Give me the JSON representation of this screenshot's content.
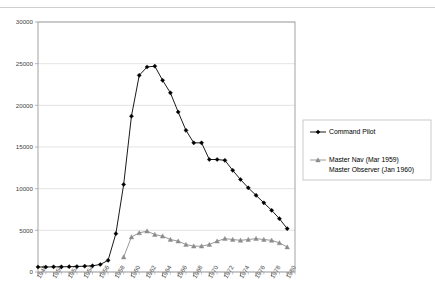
{
  "figure": {
    "top_fragment": "",
    "background": "#ffffff"
  },
  "legend": {
    "position": "right",
    "entries": [
      {
        "label": "Command Pilot",
        "color": "#000000",
        "marker": "diamond-marker"
      },
      {
        "label_line1": "Master Nav (Mar 1959)",
        "label_line2": "Master Observer (Jan 1960)",
        "color": "#8c8c8c",
        "marker": "triangle-marker"
      }
    ]
  },
  "axes": {
    "y_ticks": [
      "0",
      "5000",
      "10000",
      "15000",
      "20000",
      "25000",
      "30000"
    ],
    "x_ticks": [
      "1948",
      "1950",
      "1952",
      "1954",
      "1956",
      "1958",
      "1960",
      "1962",
      "1964",
      "1966",
      "1968",
      "1970",
      "1972",
      "1974",
      "1976",
      "1978",
      "1980"
    ]
  },
  "chart_data": {
    "type": "line",
    "title": "",
    "subtitle": "",
    "xlabel": "",
    "ylabel": "",
    "xlim": [
      1948,
      1981
    ],
    "ylim": [
      0,
      30000
    ],
    "grid": true,
    "legend_position": "right",
    "x": [
      1948,
      1949,
      1950,
      1951,
      1952,
      1953,
      1954,
      1955,
      1956,
      1957,
      1958,
      1959,
      1960,
      1961,
      1962,
      1963,
      1964,
      1965,
      1966,
      1967,
      1968,
      1969,
      1970,
      1971,
      1972,
      1973,
      1974,
      1975,
      1976,
      1977,
      1978,
      1979,
      1980
    ],
    "series": [
      {
        "name": "Command Pilot",
        "color": "#000000",
        "marker": "diamond",
        "values": [
          600,
          600,
          620,
          620,
          640,
          660,
          700,
          750,
          900,
          1400,
          4600,
          10500,
          18700,
          23600,
          24600,
          24700,
          23000,
          21500,
          19200,
          17000,
          15500,
          15500,
          13500,
          13500,
          13400,
          12200,
          11100,
          10100,
          9200,
          8300,
          7400,
          6400,
          5200
        ]
      },
      {
        "name": "Master Nav (Mar 1959) / Master Observer (Jan 1960)",
        "color": "#8c8c8c",
        "marker": "triangle",
        "values": [
          null,
          null,
          null,
          null,
          null,
          null,
          null,
          null,
          null,
          null,
          null,
          1800,
          4200,
          4700,
          4900,
          4500,
          4300,
          3900,
          3700,
          3300,
          3100,
          3100,
          3300,
          3700,
          4000,
          3900,
          3800,
          3900,
          4000,
          3900,
          3800,
          3500,
          3000
        ]
      }
    ]
  }
}
